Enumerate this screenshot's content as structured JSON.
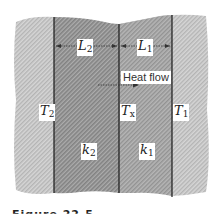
{
  "figure": {
    "type": "composite-wall-heat-conduction",
    "layers": [
      {
        "id": "outer-left",
        "shade": "#c8c8c8"
      },
      {
        "id": "layer-2",
        "thickness_label": "L",
        "thickness_sub": "2",
        "conductivity_label": "k",
        "conductivity_sub": "2",
        "shade": "#9a9a9a"
      },
      {
        "id": "layer-1",
        "thickness_label": "L",
        "thickness_sub": "1",
        "conductivity_label": "k",
        "conductivity_sub": "1",
        "shade": "#a8a8a8"
      },
      {
        "id": "outer-right",
        "shade": "#cfcfcf"
      }
    ],
    "temperatures": {
      "left": {
        "main": "T",
        "sub": "2"
      },
      "interface": {
        "main": "T",
        "sub": "x"
      },
      "right": {
        "main": "T",
        "sub": "1"
      }
    },
    "heat_flow": {
      "label": "Heat flow",
      "direction": "right"
    },
    "caption_partial": "Figure 22.5"
  }
}
